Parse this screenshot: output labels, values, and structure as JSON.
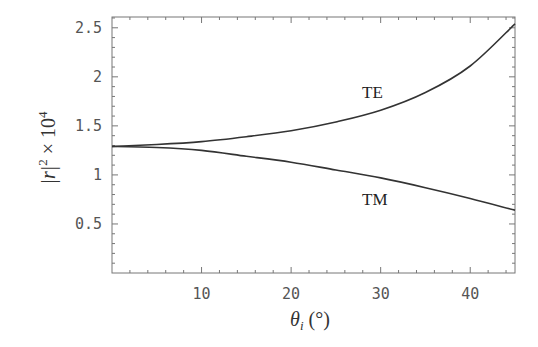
{
  "chart_data": {
    "type": "line",
    "title": "",
    "xlabel": "θ_i (°)",
    "ylabel": "|r|^2 × 10^4",
    "xlim": [
      0,
      45
    ],
    "ylim": [
      0,
      2.61
    ],
    "x_ticks": [
      10,
      20,
      30,
      40
    ],
    "x_tick_labels": [
      "10",
      "20",
      "30",
      "40"
    ],
    "x_minor_step": 2,
    "y_ticks": [
      0.5,
      1,
      1.5,
      2,
      2.5
    ],
    "y_tick_labels": [
      "0.5",
      "1",
      "1.5",
      "2",
      "2.5"
    ],
    "y_minor_step": 0.1,
    "grid": false,
    "legend": "inline curve labels",
    "x": [
      0,
      5,
      10,
      15,
      20,
      25,
      30,
      35,
      40,
      45
    ],
    "series": [
      {
        "name": "TE",
        "values": [
          1.29,
          1.31,
          1.34,
          1.39,
          1.45,
          1.54,
          1.66,
          1.84,
          2.11,
          2.54
        ]
      },
      {
        "name": "TM",
        "values": [
          1.29,
          1.28,
          1.25,
          1.19,
          1.13,
          1.05,
          0.97,
          0.87,
          0.76,
          0.64
        ]
      }
    ],
    "annotations": [
      {
        "text": "TE",
        "x": 29,
        "y": 1.84
      },
      {
        "text": "TM",
        "x": 29,
        "y": 0.75
      }
    ]
  },
  "labels": {
    "te": "TE",
    "tm": "TM",
    "x_axis_symbol": "θ",
    "x_axis_subscript": "i",
    "x_axis_unit": " (°)",
    "y_axis_main": "|r|",
    "y_axis_exp": "2",
    "y_axis_times": " × 10",
    "y_axis_power": "4"
  },
  "colors": {
    "curve": "#333333",
    "frame": "#777777",
    "text": "#555555"
  }
}
